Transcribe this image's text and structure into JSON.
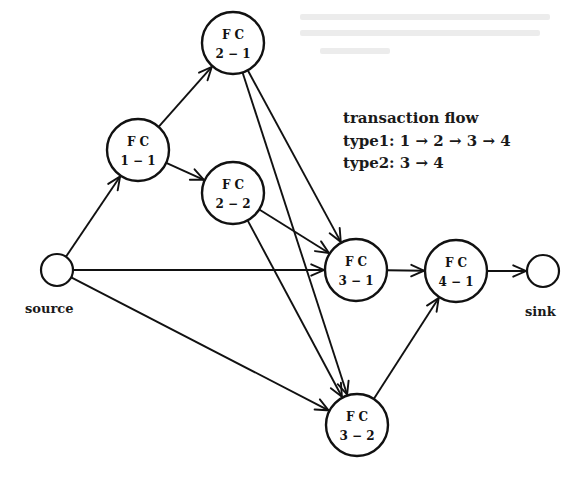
{
  "diagram": {
    "type": "network-flow",
    "nodes": [
      {
        "id": "source",
        "kind": "terminal",
        "label": "source",
        "x": 57,
        "y": 270,
        "r": 16
      },
      {
        "id": "fc11",
        "kind": "fc",
        "line1": "F C",
        "line2": "1 − 1",
        "x": 138,
        "y": 150,
        "r": 31
      },
      {
        "id": "fc21",
        "kind": "fc",
        "line1": "F C",
        "line2": "2 − 1",
        "x": 233,
        "y": 43,
        "r": 31
      },
      {
        "id": "fc22",
        "kind": "fc",
        "line1": "F C",
        "line2": "2 − 2",
        "x": 233,
        "y": 193,
        "r": 31
      },
      {
        "id": "fc31",
        "kind": "fc",
        "line1": "F C",
        "line2": "3 − 1",
        "x": 356,
        "y": 270,
        "r": 31
      },
      {
        "id": "fc32",
        "kind": "fc",
        "line1": "F C",
        "line2": "3 − 2",
        "x": 357,
        "y": 425,
        "r": 31
      },
      {
        "id": "fc41",
        "kind": "fc",
        "line1": "F C",
        "line2": "4 − 1",
        "x": 456,
        "y": 271,
        "r": 31
      },
      {
        "id": "sink",
        "kind": "terminal",
        "label": "sink",
        "x": 543,
        "y": 271,
        "r": 16
      }
    ],
    "edges": [
      {
        "from": "source",
        "to": "fc11"
      },
      {
        "from": "source",
        "to": "fc31"
      },
      {
        "from": "source",
        "to": "fc32"
      },
      {
        "from": "fc11",
        "to": "fc21"
      },
      {
        "from": "fc11",
        "to": "fc22"
      },
      {
        "from": "fc21",
        "to": "fc31"
      },
      {
        "from": "fc21",
        "to": "fc32"
      },
      {
        "from": "fc22",
        "to": "fc31"
      },
      {
        "from": "fc22",
        "to": "fc32"
      },
      {
        "from": "fc31",
        "to": "fc41"
      },
      {
        "from": "fc32",
        "to": "fc41"
      },
      {
        "from": "fc41",
        "to": "sink"
      }
    ],
    "labels": {
      "source": "source",
      "sink": "sink"
    },
    "legend": {
      "title": "transaction flow",
      "lines": [
        "type1: 1 → 2 → 3 → 4",
        "type2: 3 → 4"
      ]
    },
    "colors": {
      "ink": "#111111",
      "background": "#ffffff"
    }
  }
}
